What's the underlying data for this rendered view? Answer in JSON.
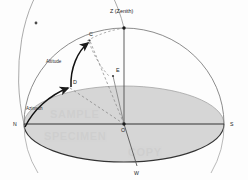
{
  "figure": {
    "background_color": "#fdfdfd",
    "horizon_fill_color": "#d6d6d6",
    "line_color": "#2b2b2b",
    "dashed_color": "#8a8a8a",
    "dome_outline_color": "#6f6f6f"
  },
  "labels": {
    "zenith": "Z (Zenith)",
    "north": "N",
    "south": "S",
    "west": "W",
    "east_point": "E",
    "star_point": "C",
    "horizon_projection_point": "D",
    "origin": "O",
    "altitude": "Altitude",
    "azimuth": "Azimuth"
  },
  "geometry": {
    "origin": {
      "x": 124,
      "y": 124
    },
    "zenith": {
      "x": 124,
      "y": 28
    },
    "north": {
      "x": 24,
      "y": 124
    },
    "south": {
      "x": 224,
      "y": 124
    },
    "west": {
      "x": 137,
      "y": 166
    },
    "east_marker": {
      "x": 113,
      "y": 76
    },
    "star": {
      "x": 89,
      "y": 40
    },
    "horizon_point": {
      "x": 69,
      "y": 87
    },
    "horizon_ellipse": {
      "cx": 124,
      "cy": 124,
      "rx": 100,
      "ry": 38
    },
    "dome_radius_x": 100,
    "dome_radius_y": 96
  },
  "markers": {
    "decorative_dot": {
      "x": 36,
      "y": 23
    }
  },
  "watermark": {
    "line1": "SAMPLE",
    "line2": "SPECIMEN",
    "line3": "COPY"
  },
  "icons": {
    "arrow_altitude": "arrow-head-icon",
    "arrow_azimuth": "arrow-head-icon",
    "point_marker": "dot-marker-icon"
  }
}
